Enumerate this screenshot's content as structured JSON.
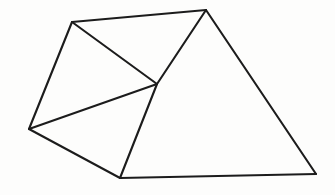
{
  "figure": {
    "background_color": "#fdfdfc",
    "line_color": "#1c1c1c",
    "line_width": 2.1,
    "width": 335,
    "height": 195,
    "vertices": [
      {
        "id": "top-left",
        "label": "A",
        "x": 72,
        "y": 22
      },
      {
        "id": "apex",
        "label": "B",
        "x": 206,
        "y": 10
      },
      {
        "id": "bottom-right",
        "label": "C",
        "x": 316,
        "y": 174
      },
      {
        "id": "bottom",
        "label": "D",
        "x": 120,
        "y": 178
      },
      {
        "id": "left",
        "label": "E",
        "x": 29,
        "y": 129
      },
      {
        "id": "center",
        "label": "F",
        "x": 157,
        "y": 84
      }
    ],
    "edges": [
      {
        "id": "edge-top-left-to-apex",
        "from": "top-left",
        "to": "apex"
      },
      {
        "id": "edge-apex-to-bottom-right",
        "from": "apex",
        "to": "bottom-right"
      },
      {
        "id": "edge-bottom-right-to-bottom",
        "from": "bottom-right",
        "to": "bottom"
      },
      {
        "id": "edge-bottom-to-left",
        "from": "bottom",
        "to": "left"
      },
      {
        "id": "edge-left-to-top-left",
        "from": "left",
        "to": "top-left"
      },
      {
        "id": "edge-top-left-to-center",
        "from": "top-left",
        "to": "center"
      },
      {
        "id": "edge-left-to-center",
        "from": "left",
        "to": "center"
      },
      {
        "id": "edge-center-to-apex",
        "from": "center",
        "to": "apex"
      },
      {
        "id": "edge-center-to-bottom",
        "from": "center",
        "to": "bottom"
      }
    ],
    "faces": [
      {
        "id": "face-upper-left",
        "vertices": [
          "top-left",
          "apex",
          "center"
        ]
      },
      {
        "id": "face-mid-left",
        "vertices": [
          "top-left",
          "center",
          "left"
        ]
      },
      {
        "id": "face-lower-left",
        "vertices": [
          "left",
          "center",
          "bottom"
        ]
      },
      {
        "id": "face-right",
        "vertices": [
          "apex",
          "bottom-right",
          "bottom",
          "center"
        ]
      }
    ]
  }
}
